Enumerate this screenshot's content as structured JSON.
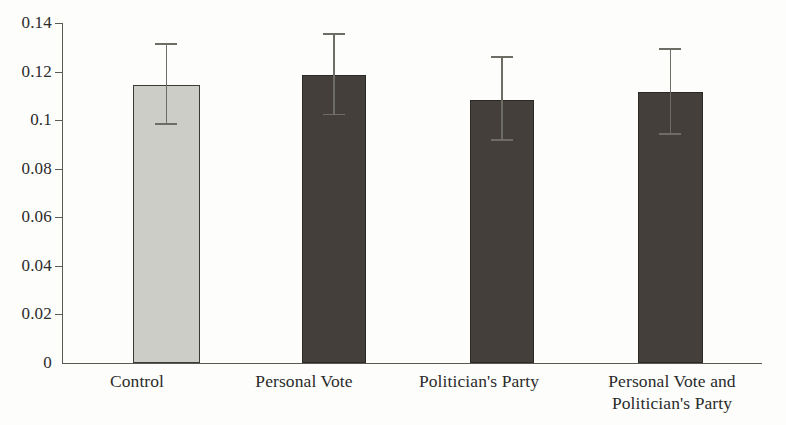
{
  "chart_data": {
    "type": "bar",
    "title": "",
    "subtitle": "",
    "xlabel": "",
    "ylabel": "",
    "categories": [
      "Control",
      "Personal Vote",
      "Politician's Party",
      "Personal Vote and Politician's Party"
    ],
    "values": [
      0.1145,
      0.1185,
      0.1085,
      0.1115
    ],
    "error_high": [
      0.131,
      0.135,
      0.1255,
      0.129
    ],
    "error_low": [
      0.098,
      0.102,
      0.0915,
      0.094
    ],
    "series": [
      {
        "name": "Proportion",
        "values": [
          0.1145,
          0.1185,
          0.1085,
          0.1115
        ]
      }
    ],
    "ylim": [
      0,
      0.14
    ],
    "yticks": [
      0,
      0.02,
      0.04,
      0.06,
      0.08,
      0.1,
      0.12,
      0.14
    ],
    "ytick_labels": [
      "0",
      "0.02",
      "0.04",
      "0.06",
      "0.08",
      "0.1",
      "0.12",
      "0.14"
    ],
    "grid": false,
    "legend": false,
    "legend_position": "none",
    "bar_colors": [
      "#cdcdc8",
      "#453f3c",
      "#453f3c",
      "#453f3c"
    ],
    "bar_edge_colors": [
      "#3a3a36",
      "#2d2926",
      "#2d2926",
      "#2d2926"
    ],
    "error_bar_color": "#6d6d65",
    "axis_color": "#5a5a52",
    "background_color": "#fdfdfb"
  },
  "axis": {
    "y_ticks": [
      {
        "label": "0.14",
        "value": 0.14
      },
      {
        "label": "0.12",
        "value": 0.12
      },
      {
        "label": "0.1",
        "value": 0.1
      },
      {
        "label": "0.08",
        "value": 0.08
      },
      {
        "label": "0.06",
        "value": 0.06
      },
      {
        "label": "0.04",
        "value": 0.04
      },
      {
        "label": "0.02",
        "value": 0.02
      },
      {
        "label": "0",
        "value": 0
      }
    ]
  },
  "x_labels": [
    {
      "line1": "Control",
      "line2": ""
    },
    {
      "line1": "Personal Vote",
      "line2": ""
    },
    {
      "line1": "Politician's Party",
      "line2": ""
    },
    {
      "line1": "Personal Vote and",
      "line2": "Politician's Party"
    }
  ]
}
